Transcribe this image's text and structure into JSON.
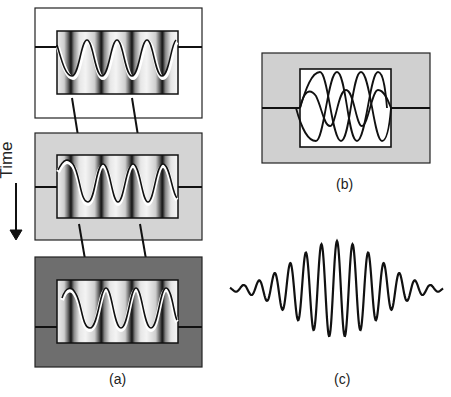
{
  "figure": {
    "panels": [
      {
        "id": "a",
        "label": "(a)",
        "description": "Three time-steps of a wave in a cavity with standing-wave intensity bands; frame backgrounds white, light gray, dark gray"
      },
      {
        "id": "b",
        "label": "(b)",
        "description": "Superposition of several oscillating modes inside a cavity"
      },
      {
        "id": "c",
        "label": "(c)",
        "description": "Wave packet with Gaussian-like envelope"
      }
    ],
    "time_axis": {
      "label": "Time",
      "direction": "down"
    },
    "colors": {
      "frame_top": "#ffffff",
      "frame_middle": "#d4d4d4",
      "frame_bottom": "#6e6e6e",
      "line": "#111111"
    }
  }
}
